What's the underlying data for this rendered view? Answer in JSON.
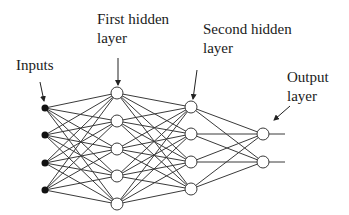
{
  "diagram": {
    "type": "feedforward-neural-network",
    "labels": {
      "inputs": "Inputs",
      "first_hidden_line1": "First hidden",
      "first_hidden_line2": "layer",
      "second_hidden_line1": "Second hidden",
      "second_hidden_line2": "layer",
      "output_line1": "Output",
      "output_line2": "layer"
    },
    "layers": [
      {
        "name": "input",
        "nodes": 4,
        "x": 45,
        "y": [
          108,
          135,
          163,
          190
        ],
        "style": "filled"
      },
      {
        "name": "first-hidden",
        "nodes": 5,
        "x": 117,
        "y": [
          93,
          121,
          149,
          176,
          204
        ],
        "style": "hollow"
      },
      {
        "name": "second-hidden",
        "nodes": 4,
        "x": 191,
        "y": [
          107,
          134,
          162,
          189
        ],
        "style": "hollow"
      },
      {
        "name": "output",
        "nodes": 2,
        "x": 263,
        "y": [
          134,
          162
        ],
        "style": "hollow"
      }
    ],
    "colors": {
      "edge": "#3a3a3a",
      "input_node": "#111111",
      "hidden_node_fill": "#ffffff",
      "text": "#1a1a1a"
    }
  }
}
